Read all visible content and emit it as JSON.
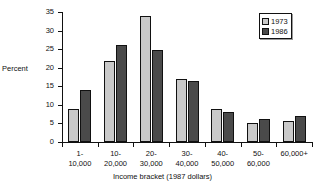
{
  "chart_data": {
    "type": "bar",
    "title": "",
    "subtitle": "",
    "xlabel": "Income bracket (1987 dollars)",
    "ylabel": "Percent",
    "ylim": [
      0,
      35
    ],
    "yticks": [
      0,
      5,
      10,
      15,
      20,
      25,
      30,
      35
    ],
    "ytick_labels": [
      "0",
      "5",
      "10",
      "15",
      "20",
      "25",
      "30",
      "35"
    ],
    "grid": false,
    "legend_position": "top-right",
    "categories": [
      "1-\n10,000",
      "10-\n20,000",
      "20-\n30,000",
      "30-\n40,000",
      "40-\n50,000",
      "50-\n60,000",
      "60,000+"
    ],
    "category_lines": [
      [
        "1-",
        "10,000"
      ],
      [
        "10-",
        "20,000"
      ],
      [
        "20-",
        "30,000"
      ],
      [
        "30-",
        "40,000"
      ],
      [
        "40-",
        "50,000"
      ],
      [
        "50-",
        "60,000"
      ],
      [
        "60,000+",
        ""
      ]
    ],
    "series": [
      {
        "name": "1973",
        "color": "#c9c9c9",
        "values": [
          9.0,
          21.7,
          34.0,
          17.0,
          9.0,
          5.0,
          5.6
        ]
      },
      {
        "name": "1986",
        "color": "#4a4a4a",
        "values": [
          14.0,
          26.0,
          24.7,
          16.3,
          8.0,
          6.2,
          7.0
        ]
      }
    ]
  },
  "legend": {
    "entries": [
      {
        "label": "1973",
        "swatch": "light-dotted-swatch"
      },
      {
        "label": "1986",
        "swatch": "dark-dotted-swatch"
      }
    ]
  },
  "axes": {
    "y_title": "Percent",
    "x_title": "Income bracket (1987 dollars)"
  },
  "colors": {
    "series_1973": "#c9c9c9",
    "series_1986": "#4a4a4a",
    "axis": "#111111",
    "background": "#ffffff"
  }
}
